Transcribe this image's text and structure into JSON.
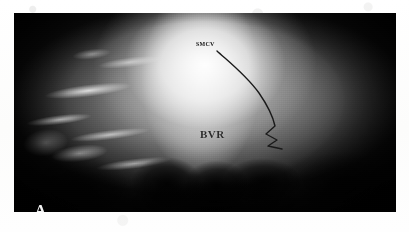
{
  "figure": {
    "modality": "cerebral-angiogram",
    "panel_letter": "A",
    "plate_background": "#000000",
    "page_background": "#ffffff"
  },
  "annotations": {
    "vessel_label_top": "SMCV",
    "vessel_label_center": "BVR",
    "trace_color": "#1a1a1a",
    "label_color_dark": "#141414",
    "label_color_panel": "#f2f2f2"
  },
  "trace": {
    "name": "vein-trace-overlay",
    "path": "M 203 38 C 214 48, 232 62, 245 80 C 254 93, 259 104, 261 113 L 252 121 L 263 127 L 254 133 L 268 136"
  }
}
